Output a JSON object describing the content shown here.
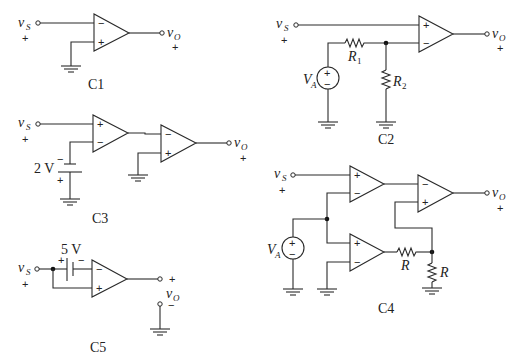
{
  "circuits": [
    {
      "id": "C1",
      "caption": "C1",
      "input_label": "v",
      "input_sub": "S",
      "output_label": "v",
      "output_sub": "O",
      "input_polarity": "+",
      "output_polarity": "+"
    },
    {
      "id": "C2",
      "caption": "C2",
      "input_label": "v",
      "input_sub": "S",
      "output_label": "v",
      "output_sub": "O",
      "input_polarity": "+",
      "output_polarity": "+",
      "source_label": "V",
      "source_sub": "A",
      "r1_label": "R",
      "r1_sub": "1",
      "r2_label": "R",
      "r2_sub": "2"
    },
    {
      "id": "C3",
      "caption": "C3",
      "input_label": "v",
      "input_sub": "S",
      "output_label": "v",
      "output_sub": "O",
      "input_polarity": "+",
      "output_polarity": "+",
      "battery_label": "2 V",
      "battery_top": "−",
      "battery_bottom": "+"
    },
    {
      "id": "C4",
      "caption": "C4",
      "input_label": "v",
      "input_sub": "S",
      "output_label": "v",
      "output_sub": "O",
      "input_polarity": "+",
      "output_polarity": "+",
      "source_label": "V",
      "source_sub": "A",
      "r_h_label": "R",
      "r_v_label": "R"
    },
    {
      "id": "C5",
      "caption": "C5",
      "input_label": "v",
      "input_sub": "S",
      "output_label": "v",
      "output_sub": "O",
      "input_polarity": "+",
      "output_top_polarity": "+",
      "output_bottom_polarity": "−",
      "battery_label": "5 V",
      "battery_left": "+",
      "battery_right": "−"
    }
  ],
  "opamp_signs": {
    "plus": "+",
    "minus": "−"
  },
  "source_signs": {
    "plus": "+",
    "minus": "−"
  }
}
